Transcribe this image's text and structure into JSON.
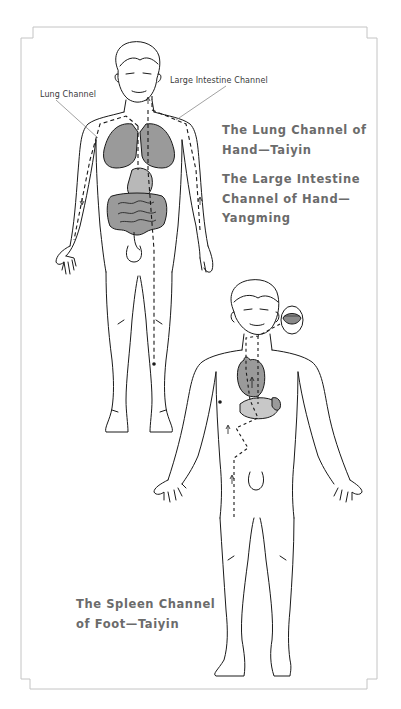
{
  "figure_top": {
    "labels": {
      "lung_channel": "Lung Channel",
      "large_intestine_channel": "Large Intestine Channel"
    },
    "caption_lung": [
      "The Lung Channel of",
      "Hand—Taiyin"
    ],
    "caption_large_intestine": [
      "The Large Intestine",
      "Channel of Hand—",
      "Yangming"
    ]
  },
  "figure_bottom": {
    "caption_spleen": [
      "The Spleen Channel",
      "of Foot—Taiyin"
    ]
  },
  "colors": {
    "frame": "#b8b8b8",
    "line": "#1a1a1a",
    "organ_fill": "#9a9a9a",
    "organ_fill_light": "#c8c8c8",
    "caption_text": "#6b6b6b"
  }
}
